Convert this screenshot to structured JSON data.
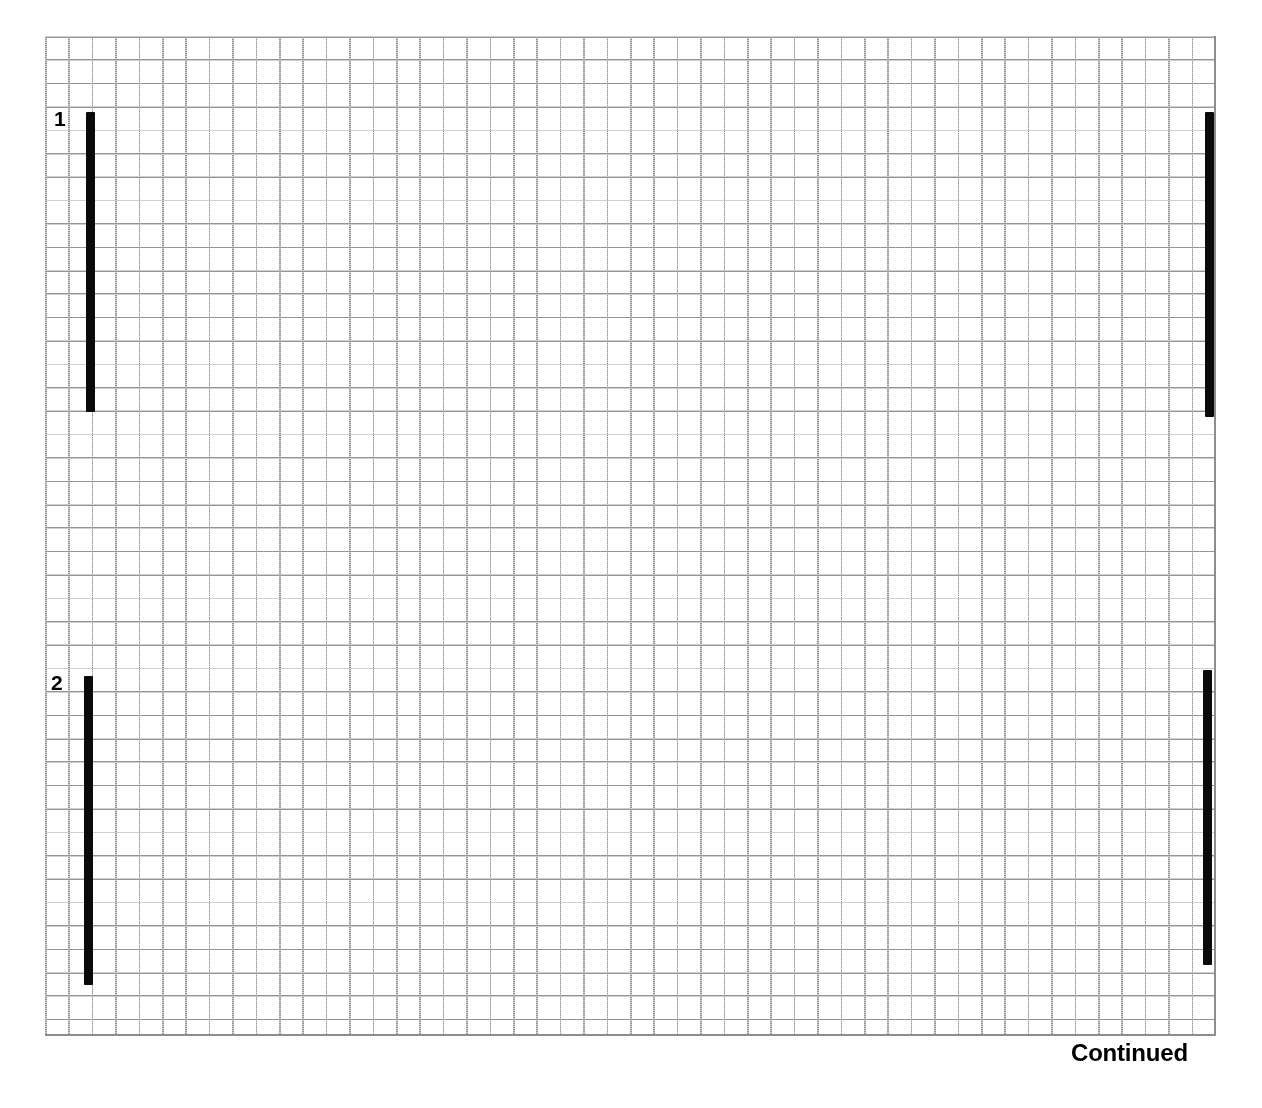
{
  "page": {
    "background_color": "#ffffff",
    "width": 1262,
    "height": 1108
  },
  "grid": {
    "line_color": "#8d8d8d",
    "cell_size_px": 23.4,
    "columns": 50,
    "rows": 43,
    "left": 45,
    "top": 36,
    "right": 1215,
    "bottom": 1036
  },
  "row_labels": [
    {
      "text": "1",
      "top": 108
    },
    {
      "text": "2",
      "top": 672
    }
  ],
  "footer": {
    "continued_label": "Continued"
  },
  "chart_data": {
    "type": "bar",
    "title": "",
    "subtitle": "",
    "xlabel": "",
    "ylabel": "",
    "grid": true,
    "legend": "none",
    "orientation": "vertical-bars-on-graph-paper",
    "bar_color": "#0a0a0a",
    "categories": [
      "1",
      "2"
    ],
    "series": [
      {
        "name": "left",
        "values": [
          300,
          309
        ]
      },
      {
        "name": "right",
        "values": [
          305,
          295
        ]
      }
    ],
    "bars": [
      {
        "row": "1",
        "side": "left",
        "left_px": 86,
        "top_px": 112,
        "width_px": 9,
        "height_px": 300
      },
      {
        "row": "1",
        "side": "right",
        "left_px": 1205,
        "top_px": 112,
        "width_px": 9,
        "height_px": 305
      },
      {
        "row": "2",
        "side": "left",
        "left_px": 84,
        "top_px": 676,
        "width_px": 9,
        "height_px": 309
      },
      {
        "row": "2",
        "side": "right",
        "left_px": 1203,
        "top_px": 670,
        "width_px": 9,
        "height_px": 295
      }
    ],
    "annotations": [
      {
        "text": "1",
        "x_px": 55,
        "y_px": 108
      },
      {
        "text": "2",
        "x_px": 52,
        "y_px": 672
      },
      {
        "text": "Continued",
        "x_px": 1071,
        "y_px": 1040
      }
    ]
  }
}
